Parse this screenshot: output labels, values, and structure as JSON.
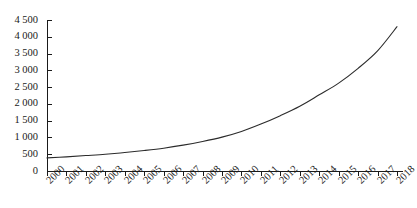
{
  "chart_data": {
    "type": "line",
    "title": "",
    "subtitle": "",
    "xlabel": "",
    "ylabel": "",
    "legend": [],
    "grid": false,
    "xlim": [
      2000,
      2018
    ],
    "ylim": [
      0,
      4500
    ],
    "ytick_step": 500,
    "categories": [
      "2000",
      "2001",
      "2002",
      "2003",
      "2004",
      "2005",
      "2006",
      "2007",
      "2008",
      "2009",
      "2010",
      "2011",
      "2012",
      "2013",
      "2014",
      "2015",
      "2016",
      "2017",
      "2018"
    ],
    "x": [
      2000,
      2001,
      2002,
      2003,
      2004,
      2005,
      2006,
      2007,
      2008,
      2009,
      2010,
      2011,
      2012,
      2013,
      2014,
      2015,
      2016,
      2017,
      2018
    ],
    "values": [
      390,
      420,
      460,
      500,
      550,
      610,
      680,
      770,
      880,
      1010,
      1180,
      1400,
      1650,
      1930,
      2270,
      2620,
      3060,
      3580,
      4300
    ],
    "ytick_labels": [
      "4 500",
      "4 000",
      "3 500",
      "3 000",
      "2 500",
      "2 000",
      "1 500",
      "1 000",
      "500",
      "0"
    ],
    "ytick_values": [
      4500,
      4000,
      3500,
      3000,
      2500,
      2000,
      1500,
      1000,
      500,
      0
    ],
    "xtick_labels": [
      "2000",
      "2001",
      "2002",
      "2003",
      "2004",
      "2005",
      "2006",
      "2007",
      "2008",
      "2009",
      "2010",
      "2011",
      "2012",
      "2013",
      "2014",
      "2015",
      "2016",
      "2017",
      "2018"
    ],
    "line_color": "#2b2b2b",
    "axis_color": "#1a1a1a",
    "background_color": "#ffffff",
    "series": [
      {
        "name": "series-1",
        "values": [
          390,
          420,
          460,
          500,
          550,
          610,
          680,
          770,
          880,
          1010,
          1180,
          1400,
          1650,
          1930,
          2270,
          2620,
          3060,
          3580,
          4300
        ]
      }
    ]
  },
  "layout": {
    "plot_left": 47,
    "plot_right": 397,
    "plot_top": 20,
    "plot_bottom": 171,
    "tick_len": 4
  }
}
